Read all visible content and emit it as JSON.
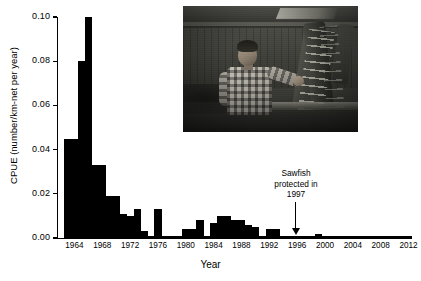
{
  "figure": {
    "title": "",
    "x_axis_title": "Year",
    "y_axis_title": "CPUE (number/km-net per year)"
  },
  "annotation": {
    "line1": "Sawfish",
    "line2": "protected in",
    "line3": "1997",
    "arrow_points_to_year": 1997
  },
  "inset": {
    "alt": "Black and white photograph of a man in a plaid shirt holding a large sawfish rostrum in a workshop"
  },
  "chart_data": {
    "type": "bar",
    "title": "",
    "xlabel": "Year",
    "ylabel": "CPUE (number/km-net per year)",
    "xlim": [
      1962,
      2013
    ],
    "ylim": [
      0.0,
      0.1
    ],
    "yticks": [
      0.0,
      0.02,
      0.04,
      0.06,
      0.08,
      0.1
    ],
    "ytick_labels": [
      "0.00",
      "0.02",
      "0.04",
      "0.06",
      "0.08",
      "0.10"
    ],
    "xticks": [
      1964,
      1968,
      1972,
      1976,
      1980,
      1984,
      1988,
      1992,
      1996,
      2000,
      2004,
      2008,
      2012
    ],
    "xtick_labels": [
      "1964",
      "1968",
      "1972",
      "1976",
      "1980",
      "1984",
      "1988",
      "1992",
      "1996",
      "2000",
      "2004",
      "2008",
      "2012"
    ],
    "grid": false,
    "legend": null,
    "bar_color": "#000000",
    "categories": [
      1963,
      1964,
      1965,
      1966,
      1967,
      1968,
      1969,
      1970,
      1971,
      1972,
      1973,
      1974,
      1975,
      1976,
      1977,
      1978,
      1979,
      1980,
      1981,
      1982,
      1983,
      1984,
      1985,
      1986,
      1987,
      1988,
      1989,
      1990,
      1991,
      1992,
      1993,
      1994,
      1995,
      1996,
      1997,
      1998,
      1999,
      2000,
      2001,
      2002,
      2003,
      2004,
      2005,
      2006,
      2007,
      2008,
      2009,
      2010,
      2011,
      2012
    ],
    "values": [
      0.045,
      0.045,
      0.08,
      0.1,
      0.033,
      0.033,
      0.019,
      0.019,
      0.011,
      0.01,
      0.013,
      0.003,
      0.0,
      0.013,
      0.0,
      0.0,
      0.0,
      0.004,
      0.004,
      0.008,
      0.0,
      0.007,
      0.01,
      0.01,
      0.008,
      0.008,
      0.006,
      0.005,
      0.0,
      0.004,
      0.004,
      0.0,
      0.0,
      0.0,
      0.0,
      0.0,
      0.002,
      0.0,
      0.0,
      0.0,
      0.0,
      0.0,
      0.0,
      0.0,
      0.0,
      0.0,
      0.0,
      0.0,
      0.0,
      0.0
    ]
  }
}
